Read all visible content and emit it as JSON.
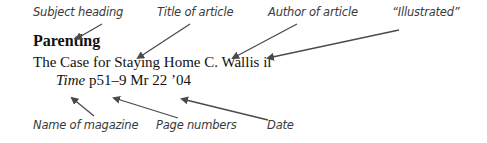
{
  "annotations": {
    "subject_heading": "Subject heading",
    "title_of_article": "Title of article",
    "author_of_article": "Author of article",
    "illustrated": "“Illustrated”",
    "name_of_magazine": "Name of magazine",
    "page_numbers": "Page numbers",
    "date": "Date"
  },
  "entry": {
    "subject": "Parenting",
    "title": "The Case for Staying Home",
    "author": "C. Wallis",
    "illustrated_abbr": "il",
    "magazine": "Time",
    "pages": "p51–9",
    "date": "Mr 22 ’04"
  },
  "colors": {
    "arrow": "#4a4a4a",
    "label_text": "#3a3a3a",
    "entry_text": "#111111"
  }
}
